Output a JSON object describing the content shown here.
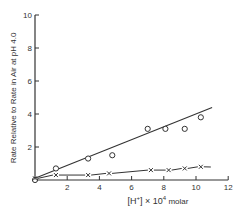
{
  "chart_data": {
    "type": "scatter",
    "title": "",
    "xlabel": "[H⁺] × 10⁻⁴ molar",
    "ylabel": "Rate Relative to Rate in Air at pH 4.0",
    "xlim": [
      0,
      12
    ],
    "ylim": [
      0,
      10
    ],
    "x_ticks": [
      2,
      4,
      6,
      8,
      10,
      12
    ],
    "y_ticks": [
      2,
      4,
      6,
      8,
      10
    ],
    "grid": false,
    "legend": null,
    "series": [
      {
        "name": "circles",
        "marker": "o",
        "x": [
          0.0,
          1.3,
          3.3,
          4.8,
          7.0,
          8.1,
          9.3,
          10.3
        ],
        "y": [
          0.0,
          0.7,
          1.3,
          1.5,
          3.1,
          3.1,
          3.1,
          3.8
        ],
        "fit_line": {
          "x": [
            0,
            11
          ],
          "y": [
            0.1,
            4.4
          ]
        }
      },
      {
        "name": "crosses",
        "marker": "x",
        "x": [
          0.0,
          1.3,
          3.3,
          4.6,
          7.2,
          8.3,
          9.3,
          10.3
        ],
        "y": [
          0.1,
          0.3,
          0.3,
          0.4,
          0.6,
          0.6,
          0.7,
          0.8
        ],
        "line_style": "dashed"
      }
    ]
  },
  "labels": {
    "ylabel": "Rate Relative to Rate in Air at pH 4.0",
    "xlabel_prefix": "[H",
    "xlabel_sup": "+",
    "xlabel_mid": "] × 10",
    "xlabel_exp": "4",
    "xlabel_suffix": " molar"
  }
}
